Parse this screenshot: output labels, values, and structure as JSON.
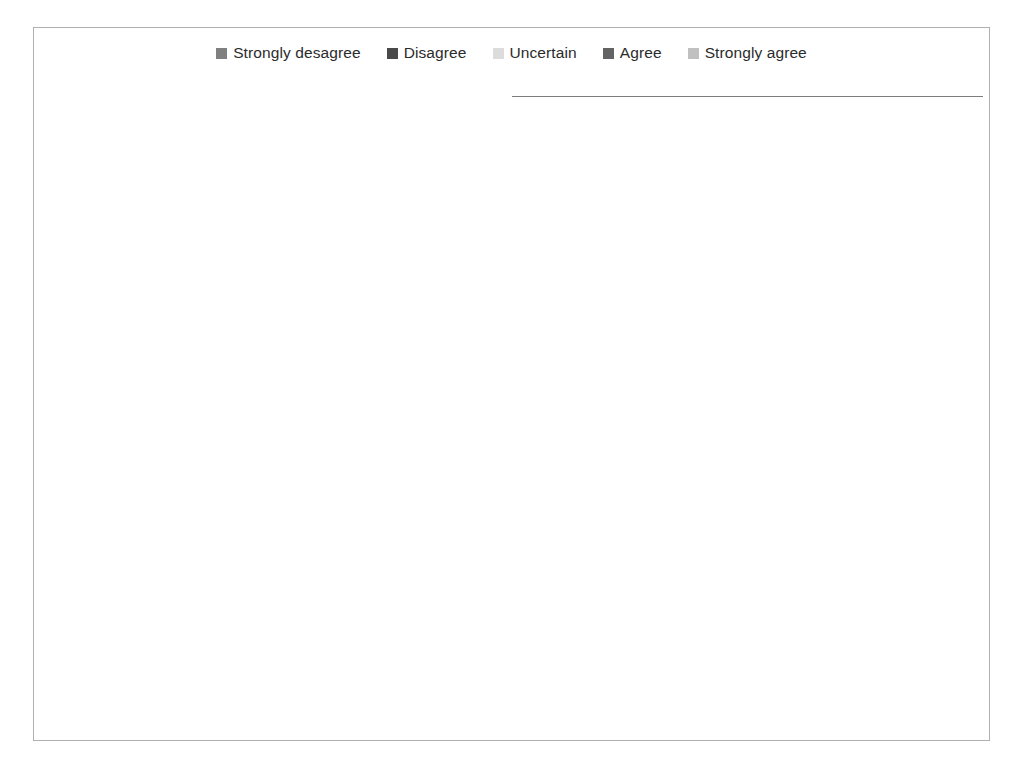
{
  "legend": {
    "position": "top-center",
    "items": [
      {
        "label": "Strongly desagree",
        "color": "#808080"
      },
      {
        "label": "Disagree",
        "color": "#4a4a4a"
      },
      {
        "label": "Uncertain",
        "color": "#dcdcdc"
      },
      {
        "label": "Agree",
        "color": "#636363"
      },
      {
        "label": "Strongly agree",
        "color": "#c0c0c0"
      }
    ]
  },
  "axis": {
    "ticks": [
      "0%",
      "20%",
      "40%",
      "60%",
      "80%",
      "100%"
    ],
    "tick_values": [
      0,
      20,
      40,
      60,
      80,
      100
    ]
  },
  "chart_data": {
    "type": "bar",
    "orientation": "horizontal",
    "stacked": true,
    "title": "",
    "xlabel": "",
    "ylabel": "",
    "xlim": [
      0,
      100
    ],
    "grid": true,
    "legend_position": "top-center",
    "tick_labels": [
      "0%",
      "20%",
      "40%",
      "60%",
      "80%",
      "100%"
    ],
    "categories": [
      "In this organisation, language barriers sometimes hamper communication (among staff, between staff and stakeholders,…",
      "In this organisation, the management provides support to any relevant employee's request for learning opportunities and…",
      "We do not have a reward system for staff members who are exemplary in sharing their knowledge",
      "In this organisation, some employees have the fear of losing power (even their job) by sharing their knowledge with others",
      "In this organisation, we do not have a formal mentorship system for new employees",
      "In this organisation, employees can express their ideas without fear of being persecuted",
      "In this organisation, some staff members lack the aptitude to explain what they know and their views to others for effective…",
      "The organisation has set challenging targets that stimulate the search for new knowledge.",
      "In this organisation, staff do not have an adequate communication infrastructure (telephone, internet) to…",
      "In this organisation, there is mutual exchange of information and views between managers and employees",
      "Our working area is not easily accessible (bad roads, long distance from the capital city) which prevents us from meeting…",
      "The organisation usually organizes appropriate fora (lectures, workshops, discussion gatherings, etc.) where we can share…",
      "In this organisation, some employees do not have the basic ability to understand the information received from others."
    ],
    "series": [
      {
        "name": "Strongly desagree",
        "color": "#808080",
        "values": [
          100,
          0,
          0,
          20,
          0,
          0,
          0,
          20,
          80,
          0,
          80,
          0,
          20
        ]
      },
      {
        "name": "Disagree",
        "color": "#4a4a4a",
        "values": [
          0,
          20,
          40,
          20,
          0,
          0,
          40,
          0,
          0,
          0,
          20,
          20,
          40
        ]
      },
      {
        "name": "Uncertain",
        "color": "#dcdcdc",
        "values": [
          0,
          20,
          0,
          0,
          40,
          0,
          20,
          40,
          0,
          0,
          0,
          80,
          0
        ]
      },
      {
        "name": "Agree",
        "color": "#636363",
        "values": [
          0,
          40,
          40,
          60,
          40,
          60,
          40,
          0,
          20,
          0,
          0,
          0,
          40
        ]
      },
      {
        "name": "Strongly agree",
        "color": "#c0c0c0",
        "values": [
          0,
          20,
          20,
          0,
          20,
          40,
          0,
          40,
          0,
          100,
          0,
          0,
          0
        ]
      }
    ],
    "rows": [
      {
        "label_key": 0,
        "segments": [
          {
            "series": 0,
            "value": 100,
            "label": "100"
          },
          {
            "series": 1,
            "value": 0,
            "label": "0"
          },
          {
            "series": 2,
            "value": 0,
            "label": ""
          },
          {
            "series": 3,
            "value": 0,
            "label": ""
          },
          {
            "series": 4,
            "value": 0,
            "label": "0"
          }
        ]
      },
      {
        "label_key": 1,
        "segments": [
          {
            "series": 0,
            "value": 0,
            "label": "0"
          },
          {
            "series": 1,
            "value": 20,
            "label": "20"
          },
          {
            "series": 2,
            "value": 20,
            "label": "20"
          },
          {
            "series": 3,
            "value": 40,
            "label": "40"
          },
          {
            "series": 4,
            "value": 20,
            "label": "20"
          }
        ]
      },
      {
        "label_key": 2,
        "segments": [
          {
            "series": 0,
            "value": 0,
            "label": "0"
          },
          {
            "series": 1,
            "value": 40,
            "label": "40"
          },
          {
            "series": 2,
            "value": 0,
            "label": "0"
          },
          {
            "series": 3,
            "value": 40,
            "label": "40"
          },
          {
            "series": 4,
            "value": 20,
            "label": "20"
          }
        ]
      },
      {
        "label_key": 3,
        "segments": [
          {
            "series": 0,
            "value": 20,
            "label": "20"
          },
          {
            "series": 1,
            "value": 20,
            "label": "20"
          },
          {
            "series": 2,
            "value": 0,
            "label": "0"
          },
          {
            "series": 3,
            "value": 60,
            "label": "60"
          },
          {
            "series": 4,
            "value": 0,
            "label": "0"
          }
        ]
      },
      {
        "label_key": 4,
        "segments": [
          {
            "series": 0,
            "value": 0,
            "label": "0"
          },
          {
            "series": 1,
            "value": 0,
            "label": ""
          },
          {
            "series": 2,
            "value": 40,
            "label": "40"
          },
          {
            "series": 3,
            "value": 40,
            "label": "40"
          },
          {
            "series": 4,
            "value": 20,
            "label": "20"
          }
        ]
      },
      {
        "label_key": 5,
        "segments": [
          {
            "series": 0,
            "value": 0,
            "label": "0"
          },
          {
            "series": 1,
            "value": 0,
            "label": ""
          },
          {
            "series": 2,
            "value": 0,
            "label": ""
          },
          {
            "series": 3,
            "value": 60,
            "label": "60"
          },
          {
            "series": 4,
            "value": 40,
            "label": "40"
          }
        ]
      },
      {
        "label_key": 6,
        "segments": [
          {
            "series": 0,
            "value": 0,
            "label": "0"
          },
          {
            "series": 1,
            "value": 40,
            "label": "40"
          },
          {
            "series": 2,
            "value": 20,
            "label": "20"
          },
          {
            "series": 3,
            "value": 40,
            "label": "40"
          },
          {
            "series": 4,
            "value": 0,
            "label": "0"
          }
        ]
      },
      {
        "label_key": 7,
        "segments": [
          {
            "series": 0,
            "value": 20,
            "label": "20"
          },
          {
            "series": 1,
            "value": 0,
            "label": "0"
          },
          {
            "series": 2,
            "value": 0,
            "label": ""
          },
          {
            "series": 3,
            "value": 40,
            "label": "40"
          },
          {
            "series": 4,
            "value": 40,
            "label": "40"
          }
        ]
      },
      {
        "label_key": 8,
        "segments": [
          {
            "series": 0,
            "value": 80,
            "label": "80"
          },
          {
            "series": 1,
            "value": 0,
            "label": "0"
          },
          {
            "series": 2,
            "value": 0,
            "label": ""
          },
          {
            "series": 3,
            "value": 20,
            "label": "20"
          },
          {
            "series": 4,
            "value": 0,
            "label": "0"
          }
        ]
      },
      {
        "label_key": 9,
        "segments": [
          {
            "series": 0,
            "value": 0,
            "label": "0"
          },
          {
            "series": 1,
            "value": 0,
            "label": ""
          },
          {
            "series": 2,
            "value": 0,
            "label": ""
          },
          {
            "series": 3,
            "value": 0,
            "label": ""
          },
          {
            "series": 4,
            "value": 100,
            "label": "100"
          }
        ]
      },
      {
        "label_key": 10,
        "segments": [
          {
            "series": 0,
            "value": 80,
            "label": "80"
          },
          {
            "series": 1,
            "value": 20,
            "label": "20"
          },
          {
            "series": 2,
            "value": 0,
            "label": ""
          },
          {
            "series": 3,
            "value": 0,
            "label": ""
          },
          {
            "series": 4,
            "value": 0,
            "label": "0"
          }
        ]
      },
      {
        "label_key": 11,
        "segments": [
          {
            "series": 0,
            "value": 0,
            "label": "0"
          },
          {
            "series": 1,
            "value": 20,
            "label": "20"
          },
          {
            "series": 2,
            "value": 80,
            "label": "80"
          },
          {
            "series": 3,
            "value": 0,
            "label": ""
          },
          {
            "series": 4,
            "value": 0,
            "label": ""
          }
        ]
      },
      {
        "label_key": 12,
        "segments": [
          {
            "series": 0,
            "value": 20,
            "label": "20"
          },
          {
            "series": 1,
            "value": 40,
            "label": "40"
          },
          {
            "series": 2,
            "value": 0,
            "label": "0"
          },
          {
            "series": 3,
            "value": 40,
            "label": "40"
          },
          {
            "series": 4,
            "value": 0,
            "label": "0"
          }
        ]
      }
    ]
  }
}
